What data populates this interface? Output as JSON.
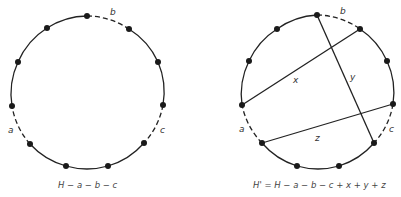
{
  "left_diagram": {
    "caption": "H − a − b − c",
    "edge_labels": {
      "a": "a",
      "b": "b",
      "c": "c"
    },
    "removed_edges": [
      "a",
      "b",
      "c"
    ]
  },
  "right_diagram": {
    "caption": "H' = H − a − b − c + x + y + z",
    "edge_labels": {
      "a": "a",
      "b": "b",
      "c": "c"
    },
    "chord_labels": {
      "x": "x",
      "y": "y",
      "z": "z"
    },
    "removed_edges": [
      "a",
      "b",
      "c"
    ],
    "added_edges": [
      "x",
      "y",
      "z"
    ]
  },
  "colors": {
    "stroke": "#222222",
    "vertex": "#1a1a1a",
    "background": "#ffffff"
  }
}
